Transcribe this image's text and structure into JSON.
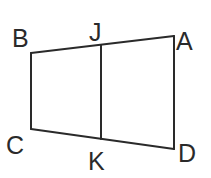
{
  "diagram": {
    "type": "geometry-figure",
    "shape": "quadrilateral divided by segment",
    "stroke_color": "#2a2a2a",
    "background_color": "#ffffff",
    "points": {
      "A": {
        "x": 174,
        "y": 36
      },
      "B": {
        "x": 31,
        "y": 53
      },
      "C": {
        "x": 31,
        "y": 129
      },
      "D": {
        "x": 174,
        "y": 149
      },
      "J": {
        "x": 101,
        "y": 45
      },
      "K": {
        "x": 101,
        "y": 139
      }
    },
    "labels": {
      "A": {
        "text": "A",
        "x": 176,
        "y": 50
      },
      "B": {
        "text": "B",
        "x": 12,
        "y": 47
      },
      "C": {
        "text": "C",
        "x": 6,
        "y": 154
      },
      "D": {
        "text": "D",
        "x": 178,
        "y": 162
      },
      "J": {
        "text": "J",
        "x": 89,
        "y": 41
      },
      "K": {
        "text": "K",
        "x": 88,
        "y": 170
      }
    },
    "segments": [
      {
        "name": "BA",
        "from": "B",
        "to": "A"
      },
      {
        "name": "AD",
        "from": "A",
        "to": "D"
      },
      {
        "name": "DC",
        "from": "D",
        "to": "C"
      },
      {
        "name": "CB",
        "from": "C",
        "to": "B"
      },
      {
        "name": "JK",
        "from": "J",
        "to": "K"
      }
    ]
  }
}
